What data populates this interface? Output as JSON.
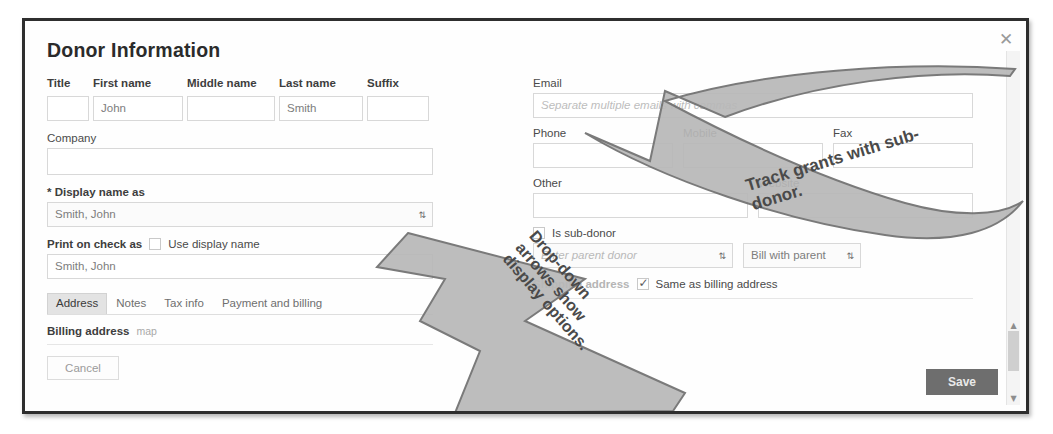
{
  "dialog": {
    "title": "Donor Information",
    "close_icon": "close-icon",
    "close_glyph": "✕"
  },
  "name_row": {
    "fields": [
      {
        "label": "Title",
        "value": "",
        "name": "title-field"
      },
      {
        "label": "First name",
        "value": "John",
        "name": "first-name-field"
      },
      {
        "label": "Middle name",
        "value": "",
        "name": "middle-name-field"
      },
      {
        "label": "Last name",
        "value": "Smith",
        "name": "last-name-field"
      },
      {
        "label": "Suffix",
        "value": "",
        "name": "suffix-field"
      }
    ]
  },
  "company": {
    "label": "Company",
    "value": ""
  },
  "display_name": {
    "label": "* Display name as",
    "value": "Smith, John",
    "caret": "⇅"
  },
  "print_on_check": {
    "label": "Print on check as",
    "checkbox_label": "Use display name",
    "checked": false,
    "value": "Smith, John"
  },
  "tabs": [
    {
      "label": "Address",
      "active": true
    },
    {
      "label": "Notes",
      "active": false
    },
    {
      "label": "Tax info",
      "active": false
    },
    {
      "label": "Payment and billing",
      "active": false
    }
  ],
  "billing": {
    "label": "Billing address",
    "map_link": "map"
  },
  "buttons": {
    "cancel": "Cancel",
    "save": "Save"
  },
  "email": {
    "label": "Email",
    "placeholder": "Separate multiple emails with commas",
    "value": ""
  },
  "phone_row": {
    "phone_label": "Phone",
    "mobile_label": "Mobile",
    "fax_label": "Fax",
    "phone_value": "",
    "mobile_value": "",
    "fax_value": ""
  },
  "other_row": {
    "other_label": "Other",
    "website_label": "Website",
    "other_value": "",
    "website_value": ""
  },
  "subdonor": {
    "checkbox_label": "Is sub-donor",
    "checked": false,
    "parent_placeholder": "Enter parent donor",
    "bill_option": "Bill with parent",
    "caret": "⇅"
  },
  "shipping": {
    "label": "Shipping address",
    "same_as_billing_label": "Same as billing address",
    "same_as_billing_checked": true
  },
  "annotations": [
    {
      "text": "Track grants with sub-donor.",
      "name": "callout-track-grants"
    },
    {
      "text": "Drop-down arrows show display options.",
      "name": "callout-dropdown-arrows"
    }
  ],
  "colors": {
    "frame": "#2e2e2e",
    "save_button": "#6e6e6e",
    "active_tab": "#e3e3e3",
    "annotation_fill": "#b8b8b8"
  }
}
